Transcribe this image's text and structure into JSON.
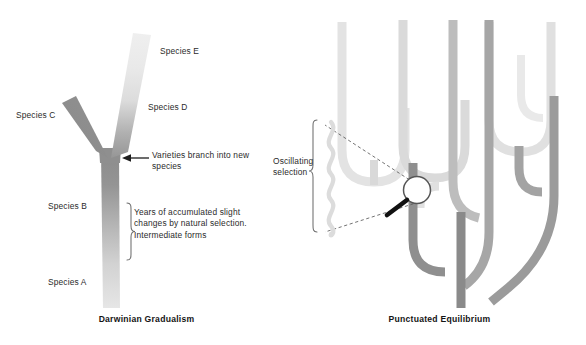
{
  "figure": {
    "kind": "evolution-comparison-diagram",
    "background_color": "#ffffff"
  },
  "panels": [
    {
      "id": "darwinian-gradualism",
      "title": "Darwinian Gradualism",
      "labels": {
        "species_e": "Species E",
        "species_d": "Species D",
        "species_c": "Species C",
        "species_b": "Species B",
        "species_a": "Species A",
        "varieties_note": "Varieties branch into new species",
        "years_note": "Years of accumulated slight changes by natural selection. Intermediate forms"
      },
      "annotations": {
        "arrow": "left-pointing-arrow",
        "brace": "right-curly-brace"
      },
      "colors": {
        "trunk_dark": "#8d8d8d",
        "trunk_light": "#e2e2e2",
        "branch_c": "#8a8a8a",
        "branch_de_top": "#ededed",
        "branch_de_bottom": "#9a9a9a"
      }
    },
    {
      "id": "punctuated-equilibrium",
      "title": "Punctuated Equilibrium",
      "labels": {
        "oscillating_selection": "Oscillating selection"
      },
      "annotations": {
        "magnifier": "magnifying-glass-icon",
        "zigzag": "oscillating-wave",
        "brace": "left-curly-brace",
        "callout": "dashed-callout-lines"
      },
      "colors": {
        "trunk": "#8a8a8a",
        "branch_mid": "#a9a9a9",
        "branch_light": "#c9c9c9",
        "branch_pale": "#dcdcdc",
        "branch_faint": "#e8e8e8"
      }
    }
  ]
}
